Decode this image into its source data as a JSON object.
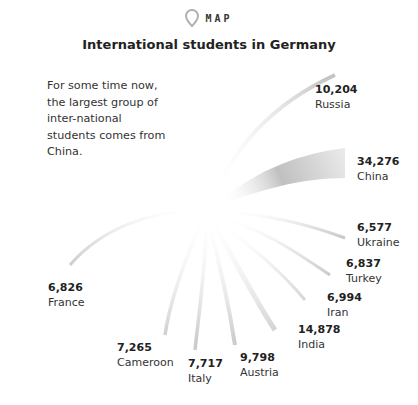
{
  "header": {
    "tag_icon": "map-pin-icon",
    "tag_label": "MAP",
    "title": "International students in Germany"
  },
  "intro_text": "For some time now, the largest group of inter-national students comes from China.",
  "colors": {
    "flow": "#c8c8c8",
    "text": "#333333",
    "icon": "#b0b0b0"
  },
  "countries": [
    {
      "name": "Russia",
      "value": "10,204"
    },
    {
      "name": "China",
      "value": "34,276"
    },
    {
      "name": "Ukraine",
      "value": "6,577"
    },
    {
      "name": "Turkey",
      "value": "6,837"
    },
    {
      "name": "Iran",
      "value": "6,994"
    },
    {
      "name": "India",
      "value": "14,878"
    },
    {
      "name": "Austria",
      "value": "9,798"
    },
    {
      "name": "Italy",
      "value": "7,717"
    },
    {
      "name": "Cameroon",
      "value": "7,265"
    },
    {
      "name": "France",
      "value": "6,826"
    }
  ]
}
